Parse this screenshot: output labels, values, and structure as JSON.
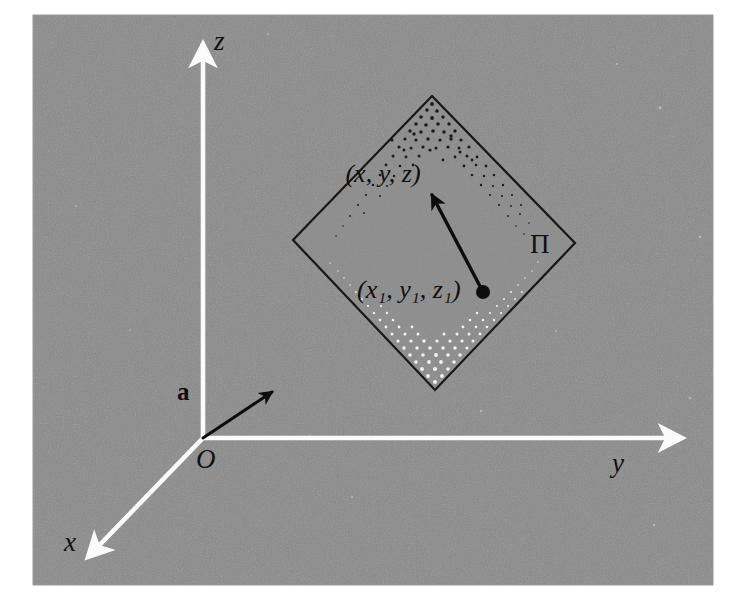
{
  "figure": {
    "kind": "3d-coordinate-diagram",
    "canvas": {
      "width": 742,
      "height": 611,
      "background": "#ffffff"
    },
    "panel": {
      "name": "gray-plate",
      "x": 33,
      "y": 15,
      "width": 680,
      "height": 570,
      "fill": "#8a8a8a",
      "noise": true
    },
    "colors": {
      "background_white": "#ffffff",
      "panel_gray": "#8a8a8a",
      "axis_white": "#fbfbfb",
      "ink_black": "#111111",
      "stipple_dark": "#1a1a1a",
      "stipple_light": "#f0f0f0"
    },
    "axes": [
      {
        "id": "z",
        "label": "z",
        "label_x": 214,
        "label_y": 50,
        "from": {
          "x": 203,
          "y": 438
        },
        "to": {
          "x": 203,
          "y": 38
        },
        "arrow": "white-triangle"
      },
      {
        "id": "y",
        "label": "y",
        "label_x": 612,
        "label_y": 472,
        "from": {
          "x": 203,
          "y": 438
        },
        "to": {
          "x": 688,
          "y": 438
        },
        "arrow": "white-triangle"
      },
      {
        "id": "x",
        "label": "x",
        "label_x": 71,
        "label_y": 551,
        "from": {
          "x": 203,
          "y": 438
        },
        "to": {
          "x": 83,
          "y": 562
        },
        "arrow": "white-triangle"
      }
    ],
    "origin": {
      "label": "O",
      "x": 203,
      "y": 438,
      "label_x": 200,
      "label_y": 466
    },
    "plane": {
      "label": "Π",
      "label_x": 540,
      "label_y": 251,
      "vertices": [
        {
          "name": "top",
          "x": 432,
          "y": 96
        },
        {
          "name": "right",
          "x": 575,
          "y": 243
        },
        {
          "name": "bottom",
          "x": 435,
          "y": 390
        },
        {
          "name": "left",
          "x": 293,
          "y": 240
        }
      ]
    },
    "normal_vector": {
      "label": "a",
      "label_x": 184,
      "label_y": 398,
      "tail": {
        "x": 203,
        "y": 438
      },
      "tip": {
        "x": 281,
        "y": 386
      }
    },
    "plane_vector": {
      "tail": {
        "x": 483,
        "y": 292
      },
      "tip": {
        "x": 428,
        "y": 187
      },
      "dot_radius": 7
    },
    "points": [
      {
        "id": "general-point",
        "label": "(x, y, z)",
        "label_x": 383,
        "label_y": 180
      },
      {
        "id": "known-point",
        "label": "(x₁, y₁, z₁)",
        "label_x": 355,
        "label_y": 297
      }
    ]
  }
}
